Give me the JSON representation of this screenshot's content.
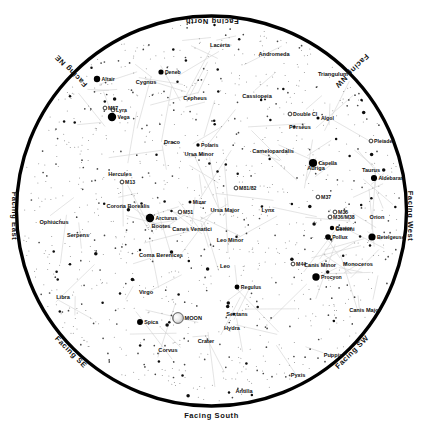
{
  "meta": {
    "view_type": "all-sky planisphere",
    "background_color": "#ffffff",
    "horizon_ring_color": "#000000",
    "star_color": "#000000",
    "constellation_line_color": "#c8c8c8",
    "label_color": "#111111"
  },
  "cardinals": [
    {
      "label": "Facing North",
      "position": "top",
      "rotation": 180
    },
    {
      "label": "Facing South",
      "position": "bottom",
      "rotation": 0
    },
    {
      "label": "Facing East",
      "position": "left",
      "rotation": 90
    },
    {
      "label": "Facing West",
      "position": "right",
      "rotation": 90
    },
    {
      "label": "Facing NE",
      "position": "top-left",
      "rotation": 225
    },
    {
      "label": "Facing NW",
      "position": "top-right",
      "rotation": 135
    },
    {
      "label": "Facing SE",
      "position": "bottom-left",
      "rotation": 45
    },
    {
      "label": "Facing SW",
      "position": "bottom-right",
      "rotation": 315
    }
  ],
  "chart_data": {
    "type": "scatter",
    "projection": "stereographic all-sky",
    "center": {
      "x": 211.5,
      "y": 211.0
    },
    "radius": 196,
    "xlabel": "",
    "ylabel": "",
    "grid": false,
    "legend": null,
    "constellations": [
      {
        "name": "Lacerta",
        "x": 220,
        "y": 47
      },
      {
        "name": "Andromeda",
        "x": 274,
        "y": 56
      },
      {
        "name": "Triangulum",
        "x": 333,
        "y": 76
      },
      {
        "name": "Cygnus",
        "x": 146,
        "y": 84
      },
      {
        "name": "Cassiopeia",
        "x": 257,
        "y": 98
      },
      {
        "name": "Cepheus",
        "x": 195,
        "y": 100
      },
      {
        "name": "Perseus",
        "x": 300,
        "y": 129
      },
      {
        "name": "Camelopardalis",
        "x": 273,
        "y": 153
      },
      {
        "name": "Draco",
        "x": 172,
        "y": 144
      },
      {
        "name": "Ursa Minor",
        "x": 199,
        "y": 156
      },
      {
        "name": "Auriga",
        "x": 316,
        "y": 170
      },
      {
        "name": "Taurus",
        "x": 371,
        "y": 172
      },
      {
        "name": "Hercules",
        "x": 120,
        "y": 176
      },
      {
        "name": "Corona Borealis",
        "x": 128,
        "y": 208
      },
      {
        "name": "Ursa Major",
        "x": 225,
        "y": 212
      },
      {
        "name": "Lynx",
        "x": 268,
        "y": 212
      },
      {
        "name": "Orion",
        "x": 377,
        "y": 219
      },
      {
        "name": "Gemini",
        "x": 345,
        "y": 231
      },
      {
        "name": "Ophiuchus",
        "x": 54,
        "y": 224
      },
      {
        "name": "Bootes",
        "x": 161,
        "y": 228
      },
      {
        "name": "Canes Venatici",
        "x": 192,
        "y": 231
      },
      {
        "name": "Serpens",
        "x": 78,
        "y": 237
      },
      {
        "name": "Leo Minor",
        "x": 230,
        "y": 242
      },
      {
        "name": "Coma Berenices",
        "x": 161,
        "y": 257
      },
      {
        "name": "Canis Minor",
        "x": 320,
        "y": 267
      },
      {
        "name": "Monoceros",
        "x": 358,
        "y": 266
      },
      {
        "name": "Leo",
        "x": 225,
        "y": 268
      },
      {
        "name": "Canis Major",
        "x": 365,
        "y": 312
      },
      {
        "name": "Virgo",
        "x": 146,
        "y": 294
      },
      {
        "name": "Sextans",
        "x": 237,
        "y": 316
      },
      {
        "name": "Libra",
        "x": 63,
        "y": 299
      },
      {
        "name": "Hydra",
        "x": 232,
        "y": 330
      },
      {
        "name": "Crater",
        "x": 206,
        "y": 343
      },
      {
        "name": "Corvus",
        "x": 168,
        "y": 352
      },
      {
        "name": "Puppis",
        "x": 333,
        "y": 357
      },
      {
        "name": "Pyxis",
        "x": 298,
        "y": 377
      },
      {
        "name": "Antilia",
        "x": 244,
        "y": 393
      }
    ],
    "stars_named": [
      {
        "name": "Deneb",
        "x": 161,
        "y": 72,
        "mag": 1.3
      },
      {
        "name": "Altair",
        "x": 97,
        "y": 79,
        "mag": 0.8
      },
      {
        "name": "Vega",
        "x": 112,
        "y": 117,
        "mag": 0.0
      },
      {
        "name": "Algol",
        "x": 318,
        "y": 118,
        "mag": 2.1
      },
      {
        "name": "Capella",
        "x": 313,
        "y": 163,
        "mag": 0.1
      },
      {
        "name": "Aldebaran",
        "x": 374,
        "y": 178,
        "mag": 0.9
      },
      {
        "name": "Polaris",
        "x": 198,
        "y": 145,
        "mag": 2.0
      },
      {
        "name": "Mizar",
        "x": 190,
        "y": 202,
        "mag": 2.2
      },
      {
        "name": "Arcturus",
        "x": 150,
        "y": 218,
        "mag": 0.0
      },
      {
        "name": "Castor",
        "x": 332,
        "y": 228,
        "mag": 1.6
      },
      {
        "name": "Pollux",
        "x": 328,
        "y": 237,
        "mag": 1.1
      },
      {
        "name": "Betelgeuse",
        "x": 372,
        "y": 237,
        "mag": 0.5
      },
      {
        "name": "Procyon",
        "x": 316,
        "y": 277,
        "mag": 0.4
      },
      {
        "name": "Regulus",
        "x": 237,
        "y": 287,
        "mag": 1.4
      },
      {
        "name": "Spica",
        "x": 140,
        "y": 322,
        "mag": 1.0
      }
    ],
    "deep_sky_objects": [
      {
        "name": "M57",
        "x": 105,
        "y": 108,
        "type": "planetary nebula"
      },
      {
        "name": "Lyra",
        "x": 113,
        "y": 110,
        "type": "constellation"
      },
      {
        "name": "Double Cl",
        "x": 290,
        "y": 114,
        "type": "open cluster"
      },
      {
        "name": "Pleiades",
        "x": 371,
        "y": 141,
        "type": "open cluster"
      },
      {
        "name": "M13",
        "x": 122,
        "y": 182,
        "type": "globular cluster"
      },
      {
        "name": "M81/82",
        "x": 236,
        "y": 188,
        "type": "galaxy pair"
      },
      {
        "name": "M37",
        "x": 318,
        "y": 197,
        "type": "open cluster"
      },
      {
        "name": "M51",
        "x": 180,
        "y": 212,
        "type": "galaxy"
      },
      {
        "name": "M35",
        "x": 335,
        "y": 212,
        "type": "open cluster"
      },
      {
        "name": "M36/M38",
        "x": 330,
        "y": 217,
        "type": "open cluster"
      },
      {
        "name": "M44",
        "x": 293,
        "y": 264,
        "type": "open cluster"
      }
    ],
    "solar_system": [
      {
        "name": "MOON",
        "x": 178,
        "y": 318,
        "phase": "gibbous",
        "symbol": "moon-disc"
      }
    ]
  }
}
